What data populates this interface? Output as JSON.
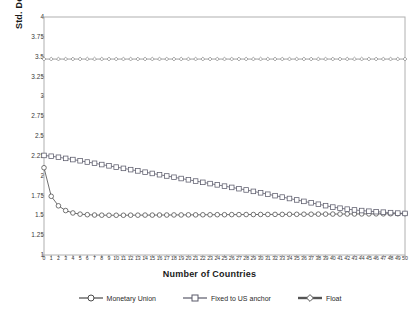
{
  "chart_data": {
    "type": "line",
    "title": "",
    "xlabel": "Number of Countries",
    "ylabel": "Std. Dev. of GDP",
    "xlim": [
      0,
      50
    ],
    "ylim": [
      1,
      4
    ],
    "ytick_step": 0.25,
    "xtick_step": 1,
    "grid": false,
    "legend_position": "bottom",
    "yticks": [
      "1",
      "1.25",
      "1.5",
      "1.75",
      "2",
      "2.25",
      "2.5",
      "2.75",
      "3",
      "3.25",
      "3.5",
      "3.75",
      "4"
    ],
    "xticks": [
      "0",
      "1",
      "2",
      "3",
      "4",
      "5",
      "6",
      "7",
      "8",
      "9",
      "10",
      "11",
      "12",
      "13",
      "14",
      "15",
      "16",
      "17",
      "18",
      "19",
      "20",
      "21",
      "22",
      "23",
      "24",
      "25",
      "26",
      "27",
      "28",
      "29",
      "30",
      "31",
      "32",
      "33",
      "34",
      "35",
      "36",
      "37",
      "38",
      "39",
      "40",
      "41",
      "42",
      "43",
      "44",
      "45",
      "46",
      "47",
      "48",
      "49",
      "50"
    ],
    "x": [
      0,
      1,
      2,
      3,
      4,
      5,
      6,
      7,
      8,
      9,
      10,
      11,
      12,
      13,
      14,
      15,
      16,
      17,
      18,
      19,
      20,
      21,
      22,
      23,
      24,
      25,
      26,
      27,
      28,
      29,
      30,
      31,
      32,
      33,
      34,
      35,
      36,
      37,
      38,
      39,
      40,
      41,
      42,
      43,
      44,
      45,
      46,
      47,
      48,
      49,
      50
    ],
    "series": [
      {
        "name": "Monetary Union",
        "marker": "circle",
        "color": "#4a4a4a",
        "values": [
          2.1,
          1.74,
          1.62,
          1.56,
          1.53,
          1.515,
          1.508,
          1.504,
          1.502,
          1.501,
          1.501,
          1.501,
          1.502,
          1.502,
          1.503,
          1.503,
          1.504,
          1.504,
          1.505,
          1.505,
          1.506,
          1.506,
          1.507,
          1.507,
          1.508,
          1.508,
          1.509,
          1.509,
          1.51,
          1.51,
          1.511,
          1.511,
          1.512,
          1.512,
          1.513,
          1.513,
          1.514,
          1.514,
          1.515,
          1.515,
          1.516,
          1.516,
          1.517,
          1.517,
          1.518,
          1.518,
          1.519,
          1.519,
          1.52,
          1.52,
          1.521
        ]
      },
      {
        "name": "Fixed to US anchor",
        "marker": "square",
        "color": "#5a5a6a",
        "values": [
          2.255,
          2.245,
          2.232,
          2.218,
          2.203,
          2.188,
          2.172,
          2.156,
          2.14,
          2.124,
          2.108,
          2.092,
          2.076,
          2.06,
          2.044,
          2.028,
          2.012,
          1.996,
          1.98,
          1.964,
          1.948,
          1.932,
          1.916,
          1.9,
          1.884,
          1.868,
          1.852,
          1.836,
          1.82,
          1.802,
          1.784,
          1.766,
          1.748,
          1.73,
          1.712,
          1.694,
          1.676,
          1.658,
          1.64,
          1.622,
          1.604,
          1.59,
          1.578,
          1.568,
          1.56,
          1.552,
          1.546,
          1.54,
          1.534,
          1.528,
          1.524
        ]
      },
      {
        "name": "Float",
        "marker": "diamond",
        "color": "#8a8a8a",
        "values": [
          3.47,
          3.47,
          3.47,
          3.47,
          3.47,
          3.47,
          3.47,
          3.47,
          3.47,
          3.47,
          3.47,
          3.47,
          3.47,
          3.47,
          3.47,
          3.47,
          3.47,
          3.47,
          3.47,
          3.47,
          3.47,
          3.47,
          3.47,
          3.47,
          3.47,
          3.47,
          3.47,
          3.47,
          3.47,
          3.47,
          3.47,
          3.47,
          3.47,
          3.47,
          3.47,
          3.47,
          3.47,
          3.47,
          3.47,
          3.47,
          3.47,
          3.47,
          3.47,
          3.47,
          3.47,
          3.47,
          3.47,
          3.47,
          3.47,
          3.47,
          3.47
        ]
      }
    ],
    "legend": [
      {
        "label": "Monetary Union",
        "marker": "circle",
        "color": "#4a4a4a"
      },
      {
        "label": "Fixed to US anchor",
        "marker": "square",
        "color": "#5a5a6a"
      },
      {
        "label": "Float",
        "marker": "diamond",
        "color": "#555555"
      }
    ],
    "plot_border_color": "#b0b0b0"
  }
}
